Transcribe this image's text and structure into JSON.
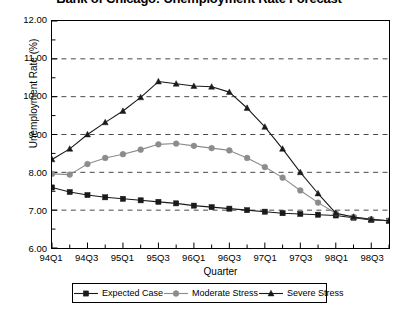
{
  "chart_data": {
    "type": "line",
    "title": "Bank of Chicago: Unemployment Rate Forecast",
    "xlabel": "Quarter",
    "ylabel": "Unemployment Rate (%)",
    "ylim": [
      6.0,
      12.0
    ],
    "ytick_step": 1.0,
    "yminor_step": 0.5,
    "grid": "horizontal-dashed-major",
    "legend_position": "bottom-outside",
    "ytick_labels": [
      "12.00",
      "11.00",
      "10.00",
      "9.00",
      "8.00",
      "7.00",
      "6.00"
    ],
    "ytick_values": [
      12.0,
      11.0,
      10.0,
      9.0,
      8.0,
      7.0,
      6.0
    ],
    "x": [
      "94Q1",
      "94Q2",
      "94Q3",
      "94Q4",
      "95Q1",
      "95Q2",
      "95Q3",
      "95Q4",
      "96Q1",
      "96Q2",
      "96Q3",
      "96Q4",
      "97Q1",
      "97Q2",
      "97Q3",
      "97Q4",
      "98Q1",
      "98Q2",
      "98Q3",
      "98Q4"
    ],
    "xtick_labels": [
      "94Q1",
      "94Q3",
      "95Q1",
      "95Q3",
      "96Q1",
      "96Q3",
      "97Q1",
      "97Q3",
      "98Q1",
      "98Q3"
    ],
    "xtick_label_indices": [
      0,
      2,
      4,
      6,
      8,
      10,
      12,
      14,
      16,
      18
    ],
    "series": [
      {
        "name": "Expected Case",
        "marker": "square",
        "color": "#1a1a1a",
        "values": [
          7.6,
          7.48,
          7.4,
          7.34,
          7.3,
          7.26,
          7.22,
          7.18,
          7.12,
          7.08,
          7.04,
          7.0,
          6.96,
          6.92,
          6.9,
          6.88,
          6.86,
          6.8,
          6.74,
          6.72
        ]
      },
      {
        "name": "Moderate Stress",
        "marker": "circle",
        "color": "#8c8c8c",
        "values": [
          7.96,
          7.94,
          8.22,
          8.38,
          8.48,
          8.6,
          8.74,
          8.76,
          8.7,
          8.64,
          8.58,
          8.38,
          8.14,
          7.86,
          7.52,
          7.2,
          6.92,
          6.82,
          6.76,
          6.72
        ]
      },
      {
        "name": "Severe Stress",
        "marker": "triangle",
        "color": "#1a1a1a",
        "values": [
          8.34,
          8.62,
          9.0,
          9.32,
          9.62,
          9.98,
          10.4,
          10.34,
          10.28,
          10.26,
          10.12,
          9.7,
          9.2,
          8.62,
          8.0,
          7.44,
          6.92,
          6.82,
          6.76,
          6.72
        ]
      }
    ]
  },
  "legend": {
    "items": [
      {
        "label": "Expected Case"
      },
      {
        "label": "Moderate Stress"
      },
      {
        "label": "Severe Stress"
      }
    ]
  }
}
